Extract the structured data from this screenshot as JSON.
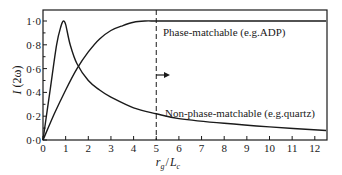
{
  "chart_data": {
    "type": "line",
    "title": "",
    "xlabel": "r_g / L_c",
    "ylabel": "I (2ω)",
    "xlim": [
      0,
      12.5
    ],
    "ylim": [
      0,
      1.1
    ],
    "grid": false,
    "x_ticks": [
      "0",
      "1",
      "2",
      "3",
      "4",
      "5",
      "6",
      "7",
      "8",
      "9",
      "10",
      "11",
      "12"
    ],
    "y_ticks": [
      "0·0",
      "0·2",
      "0·4",
      "0·6",
      "0·8",
      "1·0"
    ],
    "series": [
      {
        "name": "Phase-matchable (e.g.ADP)",
        "x": [
          0,
          0.5,
          1,
          1.5,
          2,
          2.5,
          3,
          3.5,
          4,
          4.5,
          5,
          6,
          8,
          10,
          12.5
        ],
        "values": [
          0,
          0.22,
          0.42,
          0.6,
          0.74,
          0.85,
          0.92,
          0.96,
          0.99,
          1.0,
          1.0,
          1.0,
          1.0,
          1.0,
          1.0
        ]
      },
      {
        "name": "Non-phase-matchable (e.g.quartz)",
        "x": [
          0,
          0.3,
          0.6,
          0.8,
          0.9,
          1.0,
          1.2,
          1.5,
          2,
          2.5,
          3,
          4,
          5,
          6,
          8,
          10,
          12.5
        ],
        "values": [
          0,
          0.4,
          0.8,
          0.96,
          1.0,
          0.97,
          0.8,
          0.64,
          0.5,
          0.42,
          0.36,
          0.27,
          0.22,
          0.18,
          0.14,
          0.11,
          0.08
        ]
      }
    ],
    "annotations": [
      {
        "text": "Phase-matchable (e.g.ADP)",
        "x": 5.3,
        "y": 0.92
      },
      {
        "text": "Non-phase-matchable (e.g.quartz)",
        "x": 5.3,
        "y": 0.24
      },
      {
        "type": "vline",
        "x": 5,
        "style": "dashed"
      },
      {
        "type": "arrow",
        "x": 5,
        "y": 0.5,
        "direction": "right"
      }
    ]
  },
  "labels": {
    "ylabel_main": "I",
    "ylabel_paren": "(2ω)",
    "xlabel_r": "r",
    "xlabel_g": "g",
    "xlabel_slash": "/",
    "xlabel_L": "L",
    "xlabel_c": "c",
    "anno_phase": "Phase-matchable (e.g.ADP)",
    "anno_nonphase": "Non-phase-matchable (e.g.quartz)"
  }
}
